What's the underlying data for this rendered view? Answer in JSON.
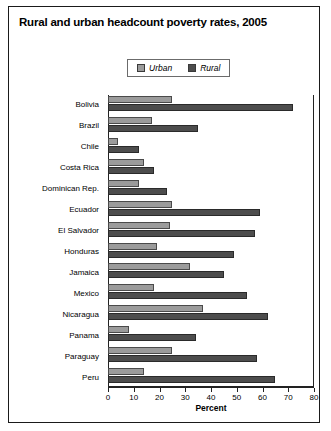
{
  "figure": {
    "title": "Rural and urban headcount poverty rates, 2005"
  },
  "legend": {
    "position": "top-center",
    "entries": [
      {
        "label": "Urban",
        "color": "#9b9b9b",
        "icon": "square-swatch-icon"
      },
      {
        "label": "Rural",
        "color": "#4d4d4d",
        "icon": "square-swatch-icon"
      }
    ]
  },
  "axes": {
    "x_label": "Percent",
    "x_ticks": [
      "0",
      "10",
      "20",
      "30",
      "40",
      "50",
      "60",
      "70",
      "80"
    ],
    "x_min": 0,
    "x_max": 80
  },
  "chart_data": {
    "type": "bar",
    "orientation": "horizontal",
    "title": "Rural and urban headcount poverty rates, 2005",
    "xlabel": "Percent",
    "ylabel": "",
    "xlim": [
      0,
      80
    ],
    "grid": false,
    "legend_position": "top-center",
    "categories": [
      "Bolivia",
      "Brazil",
      "Chile",
      "Costa Rica",
      "Dominican Rep.",
      "Ecuador",
      "El Salvador",
      "Honduras",
      "Jamaica",
      "Mexico",
      "Nicaragua",
      "Panama",
      "Paraguay",
      "Peru"
    ],
    "series": [
      {
        "name": "Urban",
        "color": "#9b9b9b",
        "values": [
          25,
          17,
          4,
          14,
          12,
          25,
          24,
          19,
          32,
          18,
          37,
          8,
          25,
          14
        ]
      },
      {
        "name": "Rural",
        "color": "#4d4d4d",
        "values": [
          72,
          35,
          12,
          18,
          23,
          59,
          57,
          49,
          45,
          54,
          62,
          34,
          58,
          65
        ]
      }
    ]
  }
}
